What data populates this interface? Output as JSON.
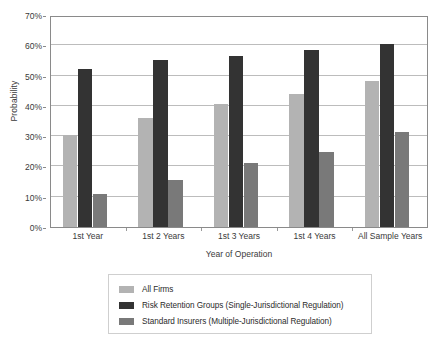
{
  "chart_data": {
    "type": "bar",
    "title": "",
    "xlabel": "Year of Operation",
    "ylabel": "Probability",
    "categories": [
      "1st Year",
      "1st 2 Years",
      "1st 3 Years",
      "1st 4 Years",
      "All Sample Years"
    ],
    "series": [
      {
        "name": "All Firms",
        "color": "#b3b3b3",
        "values": [
          30.5,
          36.0,
          40.5,
          43.8,
          48.3
        ]
      },
      {
        "name": "Risk Retention Groups (Single-Jurisdictional Regulation)",
        "color": "#333333",
        "values": [
          52.2,
          55.0,
          56.5,
          58.5,
          60.5
        ]
      },
      {
        "name": "Standard Insurers (Multiple-Jurisdictional Regulation)",
        "color": "#797979",
        "values": [
          10.8,
          15.5,
          21.0,
          24.8,
          31.3
        ]
      }
    ],
    "ylim": [
      0,
      70
    ],
    "y_ticks": [
      0,
      10,
      20,
      30,
      40,
      50,
      60,
      70
    ],
    "y_tick_labels": [
      "0%",
      "10%",
      "20%",
      "30%",
      "40%",
      "50%",
      "60%",
      "70%"
    ],
    "grid": "horizontal",
    "legend_position": "bottom-center"
  },
  "legend": {
    "items": [
      {
        "label": "All Firms"
      },
      {
        "label": "Risk Retention Groups (Single-Jurisdictional Regulation)"
      },
      {
        "label": "Standard Insurers (Multiple-Jurisdictional Regulation)"
      }
    ]
  },
  "axes": {
    "y_title": "Probability",
    "x_title": "Year of Operation"
  }
}
